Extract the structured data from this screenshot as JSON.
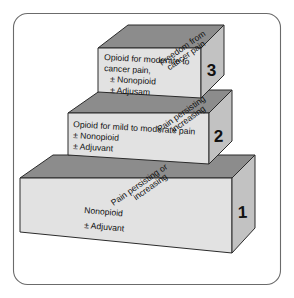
{
  "diagram": {
    "frame": {
      "name": "rounded-border"
    },
    "colors": {
      "top_face": "#8c8c8c",
      "front_face": "#e2e2e2",
      "side_face": "#c2c2c2",
      "outline": "#2b2b2b",
      "frame": "#6b6b6b",
      "text": "#111111",
      "background": "#ffffff"
    },
    "goal_label_line1": "Freedom from",
    "goal_label_line2": "cancer pain",
    "steps": [
      {
        "number": "1",
        "top_label_line1": "Pain persisting or",
        "top_label_line2": "increasing",
        "front_line1": "Nonopioid",
        "front_line2": "± Adjuvant",
        "front_line3": "",
        "front_line4": ""
      },
      {
        "number": "2",
        "top_label_line1": "Pain persisting",
        "top_label_line2": "increasing",
        "front_line1": "Opioid for mild to moderate pain",
        "front_line2": "± Nonopioid",
        "front_line3": "± Adjuvant",
        "front_line4": ""
      },
      {
        "number": "3",
        "top_label_line1": "Freedom from",
        "top_label_line2": "cancer pain",
        "front_line1": "Opioid for moderate to",
        "front_line2": "cancer pain,",
        "front_line3": "± Nonopioid",
        "front_line4": "± Adjusam"
      }
    ]
  }
}
